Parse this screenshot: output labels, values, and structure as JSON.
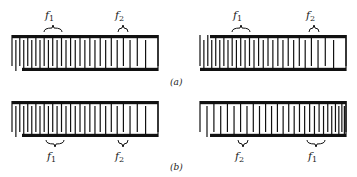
{
  "figure": {
    "ink_color": "#111111",
    "background": "#ffffff",
    "panels": [
      {
        "caption": "(a)",
        "transducers": [
          {
            "id": "a-left",
            "x0": 12,
            "x1": 158,
            "top": 35,
            "bottom": 71,
            "orientation": "forward",
            "labels": [
              {
                "text": "f",
                "sub": "1",
                "x": 50,
                "pos": "above"
              },
              {
                "text": "f",
                "sub": "2",
                "x": 120,
                "pos": "above"
              }
            ]
          },
          {
            "id": "a-right",
            "x0": 200,
            "x1": 346,
            "top": 35,
            "bottom": 71,
            "orientation": "forward-mirror",
            "labels": [
              {
                "text": "f",
                "sub": "1",
                "x": 238,
                "pos": "above"
              },
              {
                "text": "f",
                "sub": "2",
                "x": 311,
                "pos": "above"
              }
            ]
          }
        ]
      },
      {
        "caption": "(b)",
        "transducers": [
          {
            "id": "b-left",
            "x0": 12,
            "x1": 158,
            "top": 101,
            "bottom": 137,
            "orientation": "forward",
            "labels": [
              {
                "text": "f",
                "sub": "1",
                "x": 52,
                "pos": "below"
              },
              {
                "text": "f",
                "sub": "2",
                "x": 120,
                "pos": "below"
              }
            ]
          },
          {
            "id": "b-right",
            "x0": 200,
            "x1": 346,
            "top": 101,
            "bottom": 137,
            "orientation": "reversed",
            "labels": [
              {
                "text": "f",
                "sub": "2",
                "x": 240,
                "pos": "below"
              },
              {
                "text": "f",
                "sub": "1",
                "x": 313,
                "pos": "below"
              }
            ]
          }
        ]
      }
    ]
  },
  "captions": {
    "a": "(a)",
    "b": "(b)"
  },
  "labels": {
    "a_left_f1": "f",
    "a_left_f1_sub": "1",
    "a_left_f2": "f",
    "a_left_f2_sub": "2",
    "a_right_f1": "f",
    "a_right_f1_sub": "1",
    "a_right_f2": "f",
    "a_right_f2_sub": "2",
    "b_left_f1": "f",
    "b_left_f1_sub": "1",
    "b_left_f2": "f",
    "b_left_f2_sub": "2",
    "b_right_f2": "f",
    "b_right_f2_sub": "2",
    "b_right_f1": "f",
    "b_right_f1_sub": "1"
  }
}
